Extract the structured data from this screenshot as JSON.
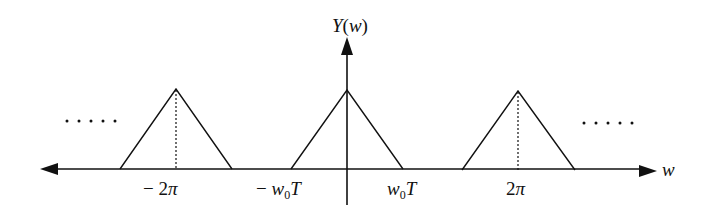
{
  "diagram": {
    "title": "Y(w)",
    "y_axis_label": "Y(w)",
    "x_axis_label": "w",
    "tick_labels": {
      "neg_2pi": "− 2π",
      "neg_w0T": "− w₀T",
      "pos_w0T": "w₀T",
      "pos_2pi": "2π"
    },
    "ellipsis_left": ".....",
    "ellipsis_right": ".....",
    "colors": {
      "stroke": "#111111",
      "background": "#ffffff"
    }
  }
}
